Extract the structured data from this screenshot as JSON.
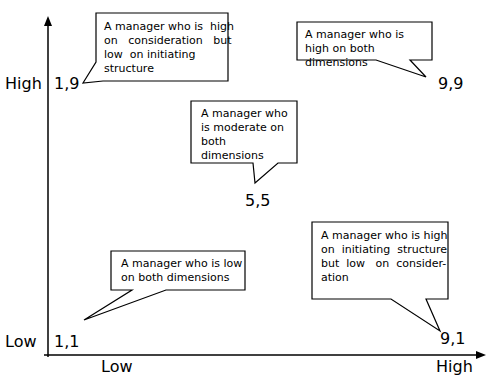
{
  "axes": {
    "y": {
      "high_label": "High",
      "low_label": "Low"
    },
    "x": {
      "low_label": "Low",
      "high_label": "High"
    }
  },
  "points": [
    {
      "id": "p19",
      "label": "1,9",
      "x": 1,
      "y": 9
    },
    {
      "id": "p99",
      "label": "9,9",
      "x": 9,
      "y": 9
    },
    {
      "id": "p55",
      "label": "5,5",
      "x": 5,
      "y": 5
    },
    {
      "id": "p11",
      "label": "1,1",
      "x": 1,
      "y": 1
    },
    {
      "id": "p91",
      "label": "9,1",
      "x": 9,
      "y": 1
    }
  ],
  "callouts": {
    "c19": "A manager who is  high on  consideration  but low  on initiating structure",
    "c99": "A manager who is high on both dimensions",
    "c55": "A manager who is moderate on both dimensions",
    "c11": "A manager who is low on both dimensions",
    "c91": "A manager who is high on  initiating  structure but  low  on  consider-ation"
  },
  "callout_lines": {
    "c19": [
      "A manager who is  high",
      "on   consideration   but",
      "low  on initiating",
      "structure"
    ],
    "c91": [
      "A manager who is high",
      "on  initiating  structure",
      "but  low   on  consider-",
      "ation"
    ]
  }
}
